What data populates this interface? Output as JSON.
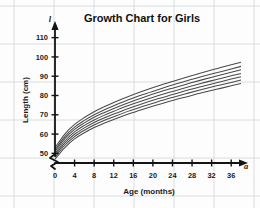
{
  "chart_data": {
    "type": "line",
    "title": "Growth Chart for Girls",
    "xlabel": "Age (months)",
    "ylabel": "Length (cm)",
    "x_variable_symbol": "a",
    "y_variable_symbol": "l",
    "xlim": [
      0,
      38
    ],
    "ylim": [
      45,
      115
    ],
    "y_axis_break": true,
    "grid": true,
    "legend": "none",
    "xticks": [
      0,
      4,
      8,
      12,
      16,
      20,
      24,
      28,
      32,
      36
    ],
    "xtick_labels": [
      "0",
      "4",
      "8",
      "12",
      "16",
      "20",
      "24",
      "28",
      "32",
      "36"
    ],
    "yticks": [
      50,
      60,
      70,
      80,
      90,
      100,
      110
    ],
    "ytick_labels": [
      "50",
      "60",
      "70",
      "80",
      "90",
      "100",
      "110"
    ],
    "x": [
      0,
      2,
      4,
      6,
      8,
      10,
      12,
      15,
      18,
      21,
      24,
      27,
      30,
      33,
      36,
      38
    ],
    "series": [
      {
        "name": "percentile-97",
        "values": [
          52.9,
          60.0,
          65.0,
          68.6,
          71.6,
          74.1,
          76.4,
          79.5,
          82.3,
          84.9,
          87.3,
          89.6,
          91.8,
          93.9,
          95.9,
          97.2
        ]
      },
      {
        "name": "percentile-90",
        "values": [
          51.8,
          58.7,
          63.6,
          67.1,
          70.0,
          72.5,
          74.7,
          77.8,
          80.5,
          83.0,
          85.4,
          87.6,
          89.8,
          91.8,
          93.8,
          95.1
        ]
      },
      {
        "name": "percentile-75",
        "values": [
          50.9,
          57.6,
          62.4,
          65.8,
          68.7,
          71.1,
          73.3,
          76.3,
          79.0,
          81.5,
          83.8,
          86.0,
          88.1,
          90.1,
          92.0,
          93.3
        ]
      },
      {
        "name": "percentile-50",
        "values": [
          49.9,
          56.4,
          61.1,
          64.5,
          67.3,
          69.7,
          71.8,
          74.8,
          77.4,
          79.9,
          82.1,
          84.3,
          86.4,
          88.3,
          90.2,
          91.4
        ]
      },
      {
        "name": "percentile-25",
        "values": [
          48.9,
          55.3,
          59.9,
          63.2,
          66.0,
          68.3,
          70.4,
          73.3,
          75.9,
          78.3,
          80.5,
          82.7,
          84.7,
          86.6,
          88.5,
          89.7
        ]
      },
      {
        "name": "percentile-10",
        "values": [
          48.0,
          54.2,
          58.7,
          62.0,
          64.7,
          67.0,
          69.0,
          71.9,
          74.4,
          76.8,
          79.0,
          81.1,
          83.1,
          85.0,
          86.8,
          88.0
        ]
      },
      {
        "name": "percentile-3",
        "values": [
          47.0,
          53.0,
          57.5,
          60.7,
          63.4,
          65.6,
          67.6,
          70.4,
          72.9,
          75.2,
          77.4,
          79.4,
          81.4,
          83.2,
          85.0,
          86.2
        ]
      }
    ]
  }
}
